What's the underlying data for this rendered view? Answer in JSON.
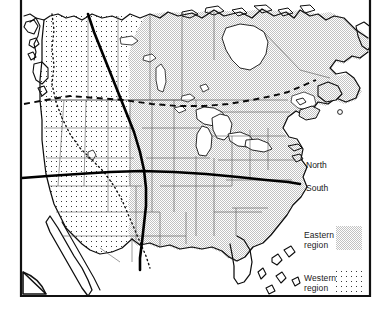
{
  "figure": {
    "kind": "thematic-map",
    "frame_color": "#000000",
    "background_color": "#ffffff"
  },
  "map": {
    "region_labels": {
      "north": "North",
      "south": "South"
    },
    "boundaries": [
      {
        "name": "east-west-divide",
        "style": "solid-thick",
        "orientation": "vertical",
        "color": "#000000"
      },
      {
        "name": "north-south-divide",
        "style": "solid-thick",
        "orientation": "horizontal",
        "color": "#000000"
      },
      {
        "name": "northern-dashed-limit",
        "style": "dashed",
        "orientation": "horizontal",
        "color": "#000000"
      },
      {
        "name": "western-region-dotted-limit",
        "style": "dotted",
        "color": "#000000"
      }
    ]
  },
  "legend": {
    "items": [
      {
        "id": "eastern",
        "label": "Eastern\nregion",
        "pattern": "dense-halftone",
        "color": "#d9d9d9"
      },
      {
        "id": "western",
        "label": "Western\nregion",
        "pattern": "sparse-dots",
        "color": "#555555"
      }
    ]
  },
  "corner_mark": {
    "name": "page-fold-triangle",
    "color": "#000000"
  }
}
